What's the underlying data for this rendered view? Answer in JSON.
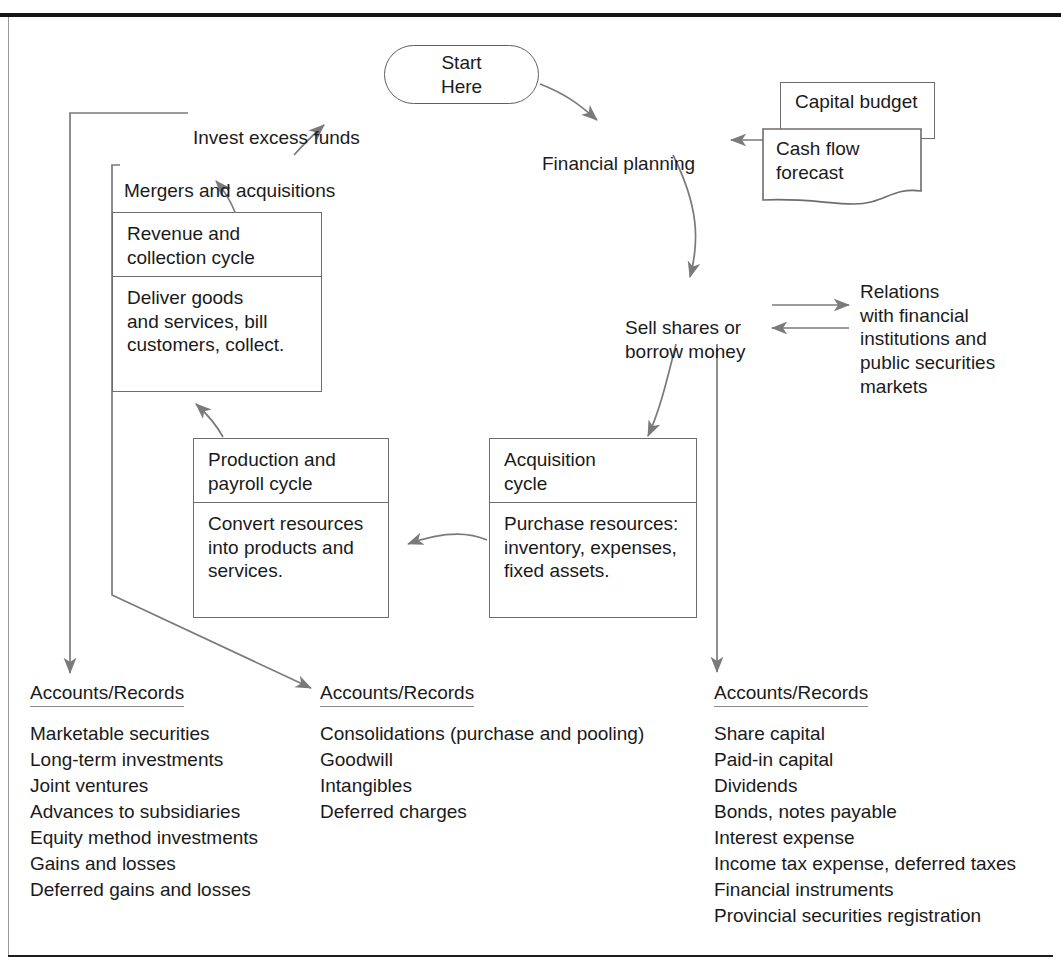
{
  "page": {
    "title_partial": "FINANCING AND INVESTING CYCLE",
    "frame_color": "#9a9a9a",
    "rule_color": "#141414",
    "line_color": "#6d6d6d",
    "text_color": "#1b1b1b"
  },
  "start": {
    "label": "Start\nHere"
  },
  "flow": {
    "financial_planning": "Financial planning",
    "sell_or_borrow": "Sell shares or\nborrow money",
    "relations": "Relations\nwith financial\ninstitutions and\npublic securities\nmarkets",
    "invest_excess_funds": "Invest excess funds",
    "mergers_and_acquisitions": "Mergers and acquisitions"
  },
  "documents": {
    "capital_budget": "Capital budget",
    "cash_flow_forecast": "Cash flow\nforecast"
  },
  "cycles": [
    {
      "name": "revenue-collection-cycle",
      "header": "Revenue and\ncollection cycle",
      "body": "Deliver goods\nand services, bill\ncustomers, collect."
    },
    {
      "name": "production-payroll-cycle",
      "header": "Production and\npayroll cycle",
      "body": "Convert resources\ninto products and\nservices."
    },
    {
      "name": "acquisition-cycle",
      "header": "Acquisition\ncycle",
      "body": "Purchase resources:\ninventory, expenses,\nfixed assets."
    }
  ],
  "accounts_records": [
    {
      "name": "accounts-records-investments",
      "heading": "Accounts/Records",
      "items": [
        "Marketable securities",
        "Long-term investments",
        "Joint ventures",
        "Advances to subsidiaries",
        "Equity method investments",
        "Gains and losses",
        "Deferred gains and losses"
      ]
    },
    {
      "name": "accounts-records-consolidations",
      "heading": "Accounts/Records",
      "items": [
        "Consolidations (purchase and pooling)",
        "Goodwill",
        "Intangibles",
        "Deferred charges"
      ]
    },
    {
      "name": "accounts-records-financing",
      "heading": "Accounts/Records",
      "items": [
        "Share capital",
        "Paid-in capital",
        "Dividends",
        "Bonds, notes payable",
        "Interest expense",
        "Income tax expense, deferred taxes",
        "Financial instruments",
        "Provincial securities registration"
      ]
    }
  ]
}
